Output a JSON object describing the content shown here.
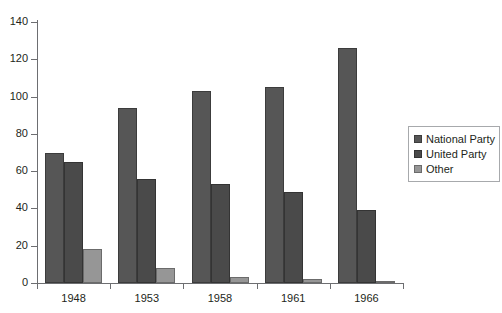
{
  "chart_data": {
    "type": "bar",
    "title": "",
    "subtitle": "",
    "xlabel": "",
    "ylabel": "",
    "categories": [
      "1948",
      "1953",
      "1958",
      "1961",
      "1966"
    ],
    "series": [
      {
        "name": "National Party",
        "color": "#565656",
        "values": [
          70,
          94,
          103,
          105,
          126
        ]
      },
      {
        "name": "United Party",
        "color": "#4a4a4a",
        "values": [
          65,
          56,
          53,
          49,
          39
        ]
      },
      {
        "name": "Other",
        "color": "#969696",
        "values": [
          18,
          8,
          3,
          2,
          1
        ]
      }
    ],
    "ylim": [
      0,
      140
    ],
    "ytick_step": 20,
    "yticks": [
      "0",
      "20",
      "40",
      "60",
      "80",
      "100",
      "120",
      "140"
    ],
    "grid": false,
    "legend_position": "right"
  },
  "legend": {
    "items": [
      {
        "label": "National Party"
      },
      {
        "label": "United Party"
      },
      {
        "label": "Other"
      }
    ]
  }
}
